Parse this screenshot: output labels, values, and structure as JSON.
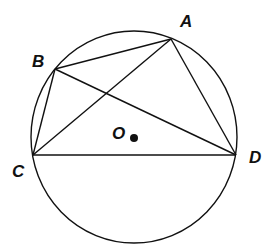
{
  "diagram": {
    "type": "geometry-circle-inscribed-quadrilateral",
    "circle": {
      "center_label": "O",
      "cx": 134,
      "cy": 137,
      "rx": 103,
      "ry": 106
    },
    "points": {
      "A": {
        "label": "A",
        "x": 171,
        "y": 39,
        "label_x": 180,
        "label_y": 27
      },
      "B": {
        "label": "B",
        "x": 55,
        "y": 69,
        "label_x": 32,
        "label_y": 67
      },
      "C": {
        "label": "C",
        "x": 33,
        "y": 155,
        "label_x": 12,
        "label_y": 177
      },
      "D": {
        "label": "D",
        "x": 236,
        "y": 155,
        "label_x": 249,
        "label_y": 163
      },
      "O": {
        "label": "O",
        "x": 133,
        "y": 137,
        "label_x": 112,
        "label_y": 139
      }
    },
    "segments": [
      [
        "B",
        "A"
      ],
      [
        "A",
        "D"
      ],
      [
        "C",
        "D"
      ],
      [
        "B",
        "C"
      ],
      [
        "C",
        "A"
      ],
      [
        "B",
        "D"
      ]
    ],
    "stroke_color": "#111111",
    "background": "#ffffff"
  }
}
